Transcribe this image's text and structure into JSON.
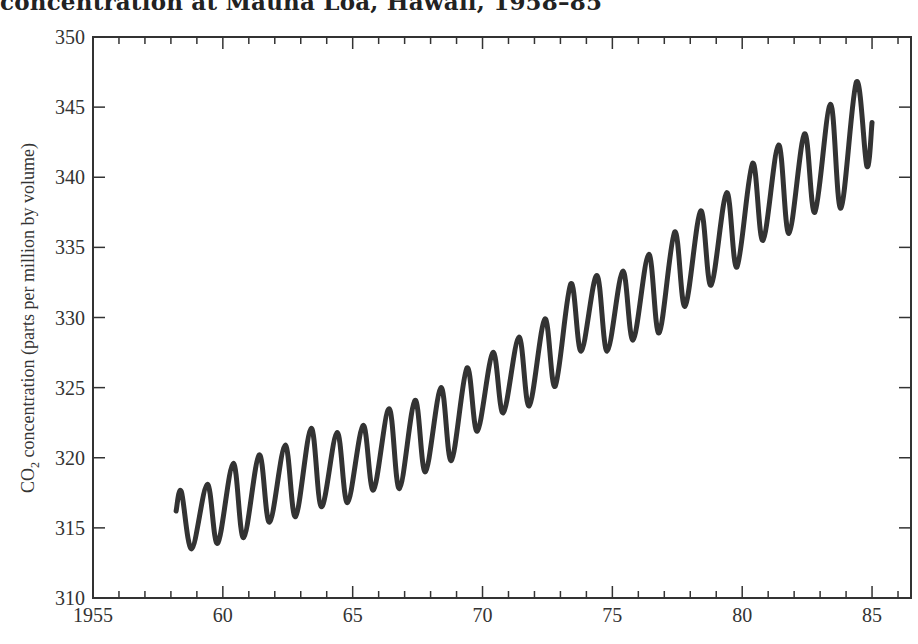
{
  "chart_data": {
    "type": "line",
    "title": "concentration at Mauna Loa, Hawaii, 1958–85",
    "xlabel": "",
    "ylabel": "CO2 concentration (parts per million by volume)",
    "ylabel_main": "CO",
    "ylabel_sub": "2",
    "ylabel_rest": " concentration (parts per million by volume)",
    "xlim": [
      1955,
      1986.5
    ],
    "ylim": [
      310,
      350
    ],
    "grid": false,
    "legend": null,
    "x_ticks": [
      1955,
      1960,
      1965,
      1970,
      1975,
      1980,
      1985
    ],
    "x_tick_labels": [
      "1955",
      "60",
      "65",
      "70",
      "75",
      "80",
      "85"
    ],
    "y_ticks": [
      310,
      315,
      320,
      325,
      330,
      335,
      340,
      345,
      350
    ],
    "y_tick_labels": [
      "310",
      "315",
      "320",
      "325",
      "330",
      "335",
      "340",
      "345",
      "350"
    ],
    "line_color": "#333333",
    "series": [
      {
        "name": "CO2 monthly concentration",
        "x": [
          1958.2,
          1958.4,
          1958.8,
          1959.4,
          1959.8,
          1960.4,
          1960.8,
          1961.4,
          1961.8,
          1962.4,
          1962.8,
          1963.4,
          1963.8,
          1964.4,
          1964.8,
          1965.4,
          1965.8,
          1966.4,
          1966.8,
          1967.4,
          1967.8,
          1968.4,
          1968.8,
          1969.4,
          1969.8,
          1970.4,
          1970.8,
          1971.4,
          1971.8,
          1972.4,
          1972.8,
          1973.4,
          1973.8,
          1974.4,
          1974.8,
          1975.4,
          1975.8,
          1976.4,
          1976.8,
          1977.4,
          1977.8,
          1978.4,
          1978.8,
          1979.4,
          1979.8,
          1980.4,
          1980.8,
          1981.4,
          1981.8,
          1982.4,
          1982.8,
          1983.4,
          1983.8,
          1984.4,
          1984.8,
          1985.0
        ],
        "values": [
          316.2,
          317.6,
          313.5,
          318.1,
          313.9,
          319.6,
          314.3,
          320.2,
          315.4,
          320.9,
          315.8,
          322.1,
          316.5,
          321.8,
          316.8,
          322.3,
          317.7,
          323.5,
          317.8,
          324.1,
          319.0,
          325.0,
          319.8,
          326.4,
          321.9,
          327.5,
          323.2,
          328.6,
          323.7,
          329.9,
          325.1,
          332.4,
          327.6,
          333.0,
          327.6,
          333.3,
          328.4,
          334.5,
          328.9,
          336.1,
          330.8,
          337.6,
          332.3,
          338.9,
          333.6,
          341.0,
          335.5,
          342.3,
          336.0,
          343.1,
          337.5,
          345.2,
          337.8,
          346.8,
          340.8,
          343.9
        ]
      }
    ]
  }
}
